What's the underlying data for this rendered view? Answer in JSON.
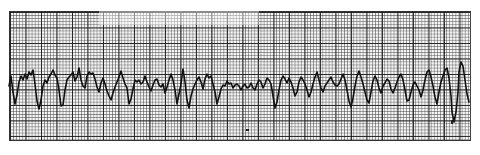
{
  "strip": {
    "kind": "ecg-rhythm-strip",
    "rhythm_appearance": "irregular chaotic waveform (ventricular fibrillation pattern)",
    "paper": {
      "left": 9,
      "top": 11,
      "width": 460,
      "height": 128,
      "minor_grid_px": 3.1,
      "major_grid_px": 15.5,
      "grid_color": "#222222",
      "paper_color": "#f4f4f4"
    },
    "trace_color": "#111111",
    "trace_points": "9,86 11,76 13,92 15,104 17,95 19,82 21,76 23,80 25,74 27,79 29,72 31,75 33,70 35,84 37,101 39,109 41,100 43,86 45,80 47,83 49,77 51,74 53,70 55,75 57,78 59,90 61,106 63,105 65,90 67,80 69,77 71,75 73,72 75,81 77,77 79,68 81,80 83,86 85,88 87,76 89,72 91,74 93,73 95,79 97,87 99,92 101,83 103,78 105,84 107,91 109,96 111,100 113,93 115,87 117,82 119,77 121,71 123,78 125,84 127,88 129,104 131,99 133,89 135,80 137,82 139,80 141,84 143,82 145,76 147,82 149,87 151,91 153,85 155,80 157,79 159,85 161,87 163,84 165,93 167,87 169,80 171,74 173,80 175,90 177,104 179,94 181,84 183,69 185,82 187,100 189,108 191,96 193,89 195,84 197,80 199,77 201,82 203,89 205,79 207,74 209,78 211,76 213,84 215,92 217,104 219,97 221,89 223,85 225,86 227,81 229,84 231,83 233,88 235,85 237,84 239,86 241,90 243,86 245,84 247,88 249,87 251,83 253,88 255,90 257,84 259,80 261,82 263,88 265,84 267,78 269,80 271,84 273,96 275,108 277,102 279,90 281,80 283,76 285,79 287,83 289,78 291,82 293,88 295,96 297,92 299,82 301,77 303,80 305,84 307,90 309,97 311,92 313,84 315,77 317,72 319,80 321,88 323,92 325,86 327,83 329,80 331,77 333,82 335,85 337,86 339,84 341,79 343,74 345,80 347,90 349,101 351,107 353,98 355,86 357,76 359,71 361,77 363,84 365,92 367,100 369,103 371,92 373,81 375,76 377,80 379,88 381,93 383,86 385,83 387,79 389,81 391,89 393,93 395,88 397,82 399,77 401,74 403,80 405,90 407,101 409,100 411,92 413,85 415,82 417,86 419,90 421,97 423,90 425,80 427,72 429,70 431,77 433,86 435,97 437,104 439,92 441,82 443,76 445,70 447,68 449,78 451,96 452,112 454,122 456,112 458,92 459,72 461,62 463,66 465,80 467,94 469,102",
    "marks": [
      {
        "x": 246,
        "y": 129,
        "w": 3,
        "h": 2
      },
      {
        "x": 451,
        "y": 120,
        "w": 2,
        "h": 4
      }
    ]
  }
}
